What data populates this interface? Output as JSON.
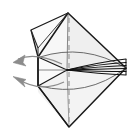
{
  "figure": {
    "type": "line-drawing",
    "background_color": "#ffffff",
    "canvas": {
      "width": 135,
      "height": 135
    }
  },
  "colors": {
    "outline": "#1a1a1a",
    "crease_line": "#4a4a4a",
    "fold_bundle": "#111111",
    "arrow": "#8c8c8c",
    "center_axis_dashed": "#9a9a9a",
    "fill_light": "#f6f6f6",
    "fill_mid": "#efefef",
    "fill_shade": "#e7e7e7",
    "fill_pale": "#fbfbfb"
  },
  "geometry": {
    "top_vertex": {
      "x": 68,
      "y": 13
    },
    "bottom_vertex": {
      "x": 69,
      "y": 127
    },
    "right_vertex": {
      "x": 126,
      "y": 68
    },
    "center_hinge": {
      "x": 67,
      "y": 70
    },
    "left_edge_top": {
      "x": 38,
      "y": 57
    },
    "left_edge_bottom": {
      "x": 38,
      "y": 86
    },
    "upper_flap_tip": {
      "x": 31,
      "y": 30
    },
    "dashed_axis": {
      "x": 69,
      "y_top": 18,
      "y_bottom": 124
    }
  },
  "elements": {
    "outer_polygon": {
      "name": "outer-kite-body",
      "points": "68,13 126,68 69,127 38,86 38,57"
    },
    "upper_right_panel": {
      "name": "upper-right-panel",
      "points": "68,13 126,68 67,70"
    },
    "lower_right_panel": {
      "name": "lower-right-panel",
      "points": "126,68 69,127 67,70"
    },
    "upper_left_panel": {
      "name": "upper-left-panel",
      "points": "68,13 67,70 38,57 38,48"
    },
    "lower_left_panel": {
      "name": "lower-left-panel",
      "points": "67,70 69,127 38,92 38,86"
    },
    "left_mid_panel": {
      "name": "left-middle-panel",
      "points": "38,57 67,70 38,86"
    },
    "upper_flap": {
      "name": "upper-left-flap",
      "points": "68,13 31,30 38,57 38,48"
    }
  },
  "fold_bundle": {
    "name": "fan-of-fold-lines",
    "description": "bundle of near-parallel fold lines from center hinge to right vertex",
    "count": 6,
    "from": {
      "x": 67,
      "y": 70
    },
    "to": {
      "x": 126,
      "y": 68
    },
    "spread_offsets": [
      -9,
      -5.5,
      -2.5,
      0.5,
      3.5,
      7
    ]
  },
  "arcs": {
    "upper_arc": {
      "name": "upper-curved-edge",
      "path": "M 40,57 Q 84,43 126,68"
    },
    "lower_arc": {
      "name": "lower-curved-edge",
      "path": "M 40,86 Q 86,98 126,68"
    }
  },
  "arrows": [
    {
      "name": "fold-arrow-upper",
      "label": "",
      "path": "M 62,64 Q 36,52 16,60",
      "tip": {
        "x": 14,
        "y": 61
      },
      "angle_deg": 203
    },
    {
      "name": "fold-arrow-lower",
      "label": "",
      "path": "M 64,82 Q 38,92 16,78",
      "tip": {
        "x": 14,
        "y": 77
      },
      "angle_deg": 200
    }
  ],
  "center_crease": {
    "name": "horizontal-center-crease",
    "from": {
      "x": 39,
      "y": 70
    },
    "to": {
      "x": 67,
      "y": 70
    }
  }
}
